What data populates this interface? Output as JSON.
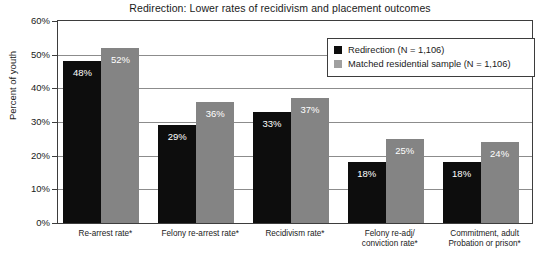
{
  "chart_data": {
    "type": "bar",
    "title": "Redirection: Lower rates of recidivism and placement outcomes",
    "xlabel": "",
    "ylabel": "Percent of youth",
    "ylim": [
      0,
      60
    ],
    "ytick_labels": [
      "60%",
      "50%",
      "40%",
      "30%",
      "20%",
      "10%",
      "0%"
    ],
    "ytick_values": [
      60,
      50,
      40,
      30,
      20,
      10,
      0
    ],
    "grid": true,
    "legend_position": "upper right",
    "categories": [
      "Re-arrest rate*",
      "Felony re-arrest rate*",
      "Recidivism rate*",
      "Felony re-adj/\nconviction rate*",
      "Commitment, adult\nProbation or prison*"
    ],
    "category_lines": [
      [
        "Re-arrest rate*"
      ],
      [
        "Felony re-arrest rate*"
      ],
      [
        "Recidivism rate*"
      ],
      [
        "Felony re-adj/",
        "conviction rate*"
      ],
      [
        "Commitment, adult",
        "Probation or prison*"
      ]
    ],
    "series": [
      {
        "name": "Redirection (N = 1,106)",
        "color": "#0d0d0d",
        "values": [
          48,
          29,
          33,
          18,
          18
        ],
        "labels": [
          "48%",
          "29%",
          "33%",
          "18%",
          "18%"
        ]
      },
      {
        "name": "Matched residential sample (N = 1,106)",
        "color": "#848484",
        "values": [
          52,
          36,
          37,
          25,
          24
        ],
        "labels": [
          "52%",
          "36%",
          "37%",
          "25%",
          "24%"
        ]
      }
    ]
  },
  "colors": {
    "series_0": "#0d0d0d",
    "series_1": "#848484",
    "gridline": "#8c8c8c",
    "frame": "#3d3d3d",
    "background": "#ffffff",
    "text": "#1a1a1a"
  }
}
